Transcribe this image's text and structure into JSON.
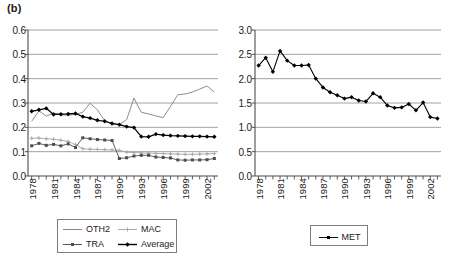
{
  "figure": {
    "panel_label": "(b)"
  },
  "left_panel": {
    "legend": [
      {
        "label": "OTH2",
        "key": "plain-line"
      },
      {
        "label": "MAC",
        "key": "light-line-marker"
      },
      {
        "label": "TRA",
        "key": "line-marker"
      },
      {
        "label": "Average",
        "key": "bold-line-diamond"
      }
    ]
  },
  "right_panel": {
    "legend": [
      {
        "label": "MET",
        "key": "line-marker"
      }
    ]
  },
  "chart_data": [
    {
      "type": "line",
      "title": "(b)",
      "panel": "left",
      "xlabel": "",
      "ylabel": "",
      "xlim": [
        1978,
        2003
      ],
      "ylim": [
        0.0,
        0.6
      ],
      "grid": "horizontal",
      "legend_position": "below",
      "x": [
        1978,
        1979,
        1980,
        1981,
        1982,
        1983,
        1984,
        1985,
        1986,
        1987,
        1988,
        1989,
        1990,
        1991,
        1992,
        1993,
        1994,
        1995,
        1996,
        1997,
        1998,
        1999,
        2000,
        2001,
        2002,
        2003
      ],
      "xticks": [
        1978,
        1981,
        1984,
        1987,
        1990,
        1993,
        1996,
        1999,
        2002
      ],
      "xtick_labels": [
        "1978",
        "1981",
        "1984",
        "1987",
        "1990",
        "1993",
        "1996",
        "1999",
        "2002"
      ],
      "yticks": [
        0.0,
        0.1,
        0.2,
        0.3,
        0.4,
        0.5,
        0.6
      ],
      "ytick_labels": [
        "0.0",
        "0.1",
        "0.2",
        "0.3",
        "0.4",
        "0.5",
        "0.6"
      ],
      "series": [
        {
          "name": "OTH2",
          "color": "#808080",
          "marker": "none",
          "values": [
            0.225,
            0.268,
            0.246,
            0.259,
            0.251,
            0.25,
            0.253,
            0.262,
            0.299,
            0.272,
            0.227,
            0.213,
            0.211,
            0.232,
            0.32,
            0.262,
            0.255,
            0.247,
            0.24,
            0.286,
            0.334,
            0.337,
            0.345,
            0.357,
            0.37,
            0.345,
            0.395,
            0.468
          ]
        },
        {
          "name": "MAC",
          "color": "#a6a6a6",
          "marker": "plus",
          "values": [
            0.155,
            0.156,
            0.153,
            0.151,
            0.147,
            0.142,
            0.129,
            0.112,
            0.11,
            0.109,
            0.108,
            0.107,
            0.105,
            0.098,
            0.096,
            0.095,
            0.094,
            0.093,
            0.092,
            0.091,
            0.09,
            0.089,
            0.089,
            0.09,
            0.091,
            0.092,
            0.093,
            0.09
          ]
        },
        {
          "name": "TRA",
          "color": "#4d4d4d",
          "marker": "square",
          "values": [
            0.124,
            0.134,
            0.126,
            0.13,
            0.124,
            0.132,
            0.117,
            0.157,
            0.153,
            0.15,
            0.148,
            0.146,
            0.072,
            0.075,
            0.082,
            0.085,
            0.085,
            0.078,
            0.076,
            0.074,
            0.066,
            0.065,
            0.066,
            0.066,
            0.067,
            0.072,
            0.071,
            0.058
          ]
        },
        {
          "name": "Average",
          "color": "#000000",
          "marker": "diamond",
          "values": [
            0.266,
            0.272,
            0.278,
            0.253,
            0.254,
            0.255,
            0.257,
            0.244,
            0.238,
            0.229,
            0.225,
            0.216,
            0.211,
            0.203,
            0.199,
            0.162,
            0.161,
            0.172,
            0.168,
            0.166,
            0.165,
            0.164,
            0.163,
            0.163,
            0.162,
            0.161,
            0.16,
            0.158
          ]
        }
      ]
    },
    {
      "type": "line",
      "panel": "right",
      "xlabel": "",
      "ylabel": "",
      "xlim": [
        1978,
        2003
      ],
      "ylim": [
        0.0,
        3.0
      ],
      "grid": "horizontal",
      "legend_position": "below",
      "x": [
        1978,
        1979,
        1980,
        1981,
        1982,
        1983,
        1984,
        1985,
        1986,
        1987,
        1988,
        1989,
        1990,
        1991,
        1992,
        1993,
        1994,
        1995,
        1996,
        1997,
        1998,
        1999,
        2000,
        2001,
        2002,
        2003
      ],
      "xticks": [
        1978,
        1981,
        1984,
        1987,
        1990,
        1993,
        1996,
        1999,
        2002
      ],
      "xtick_labels": [
        "1978",
        "1981",
        "1984",
        "1987",
        "1990",
        "1993",
        "1996",
        "1999",
        "2002"
      ],
      "yticks": [
        0.0,
        0.5,
        1.0,
        1.5,
        2.0,
        2.5,
        3.0
      ],
      "ytick_labels": [
        "0.0",
        "0.5",
        "1.0",
        "1.5",
        "2.0",
        "2.5",
        "3.0"
      ],
      "series": [
        {
          "name": "MET",
          "color": "#000000",
          "marker": "diamond",
          "values": [
            2.27,
            2.43,
            2.14,
            2.57,
            2.37,
            2.27,
            2.27,
            2.28,
            2.0,
            1.82,
            1.72,
            1.66,
            1.59,
            1.62,
            1.55,
            1.53,
            1.7,
            1.62,
            1.45,
            1.4,
            1.41,
            1.48,
            1.35,
            1.51,
            1.21,
            1.18
          ]
        }
      ]
    }
  ]
}
